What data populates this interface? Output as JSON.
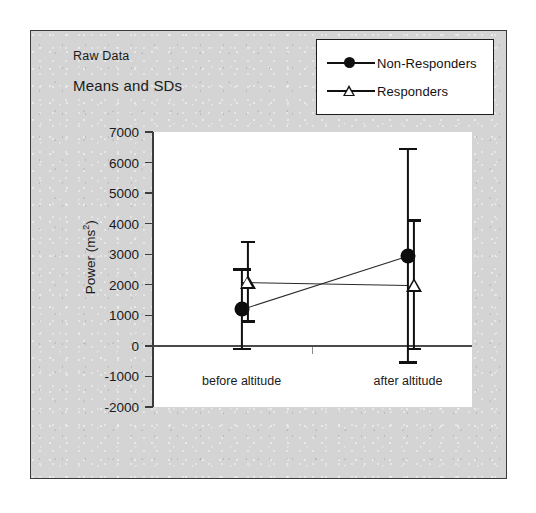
{
  "figure": {
    "title_line1": "Raw Data",
    "title_line2": "Means and SDs"
  },
  "legend": {
    "position": "top-right",
    "entries": [
      {
        "label": "Non-Responders",
        "marker": "filled-circle-icon",
        "color": "#111111"
      },
      {
        "label": "Responders",
        "marker": "open-triangle-icon",
        "color": "#111111"
      }
    ]
  },
  "chart_data": {
    "type": "line",
    "xlabel": "",
    "ylabel": "Power (ms²)",
    "categories": [
      "before altitude",
      "after altitude"
    ],
    "ylim": [
      -2000,
      7000
    ],
    "yticks": [
      7000,
      6000,
      5000,
      4000,
      3000,
      2000,
      1000,
      0,
      -1000,
      -2000
    ],
    "ytick_labels": [
      "7000",
      "6000",
      "5000",
      "4000",
      "3000",
      "2000",
      "1000",
      "0",
      "-1000",
      "-2000"
    ],
    "grid": false,
    "errorbars": "SD",
    "series": [
      {
        "name": "Non-Responders",
        "marker": "filled-circle",
        "values": [
          1200,
          2950
        ],
        "errors": [
          1300,
          3500
        ],
        "lower": [
          -100,
          -550
        ],
        "upper": [
          2500,
          6450
        ]
      },
      {
        "name": "Responders",
        "marker": "open-triangle",
        "values": [
          2100,
          2000
        ],
        "errors": [
          1300,
          2100
        ],
        "lower": [
          800,
          -100
        ],
        "upper": [
          3400,
          4100
        ]
      }
    ]
  },
  "colors": {
    "figure_background": "#d4d4d4",
    "plot_background": "#ffffff",
    "ink": "#111111",
    "axis": "#3c3c3c"
  }
}
